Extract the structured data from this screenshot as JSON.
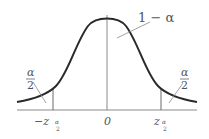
{
  "diagram": {
    "curve": "normal-density",
    "center_label": "0",
    "left_tick_label_main": "−z",
    "left_tick_label_sub_num": "α",
    "left_tick_label_sub_den": "2",
    "right_tick_label_main": "z",
    "right_tick_label_sub_num": "α",
    "right_tick_label_sub_den": "2",
    "middle_area_label": "1 − α",
    "left_tail_num": "α",
    "left_tail_den": "2",
    "right_tail_num": "α",
    "right_tail_den": "2",
    "colors": {
      "curve": "#2a2a2a",
      "axis": "#8a8a8a",
      "text": "#555555"
    }
  }
}
